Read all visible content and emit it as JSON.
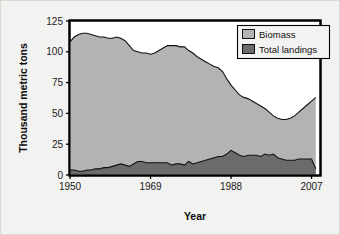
{
  "chart_data": {
    "type": "area",
    "title": "",
    "xlabel": "Year",
    "ylabel": "Thousand metric tons",
    "xlim": [
      1950,
      2009
    ],
    "ylim": [
      0,
      125
    ],
    "xticks": [
      1950,
      1969,
      1988,
      2007
    ],
    "yticks": [
      0,
      25,
      50,
      75,
      100,
      125
    ],
    "grid": false,
    "stacked": false,
    "legend_position": "top-right",
    "legend": [
      "Biomass",
      "Total landings"
    ],
    "colors": {
      "biomass": "#b3b3b3",
      "total_landings": "#6b6b6b",
      "outline": "#111111",
      "frame": "#000000",
      "plot_background": "#ffffff",
      "figure_background": "#f2f2f0"
    },
    "x": [
      1950,
      1951,
      1952,
      1953,
      1954,
      1955,
      1956,
      1957,
      1958,
      1959,
      1960,
      1961,
      1962,
      1963,
      1964,
      1965,
      1966,
      1967,
      1968,
      1969,
      1970,
      1971,
      1972,
      1973,
      1974,
      1975,
      1976,
      1977,
      1978,
      1979,
      1980,
      1981,
      1982,
      1983,
      1984,
      1985,
      1986,
      1987,
      1988,
      1989,
      1990,
      1991,
      1992,
      1993,
      1994,
      1995,
      1996,
      1997,
      1998,
      1999,
      2000,
      2001,
      2002,
      2003,
      2004,
      2005,
      2006,
      2007,
      2008
    ],
    "series": [
      {
        "name": "Biomass",
        "values": [
          108,
          112,
          114,
          115,
          115,
          114,
          113,
          112,
          112,
          111,
          111,
          112,
          111,
          109,
          105,
          101,
          100,
          99,
          99,
          98,
          99,
          101,
          103,
          105,
          105,
          105,
          104,
          104,
          101,
          99,
          96,
          94,
          92,
          90,
          88,
          87,
          84,
          78,
          73,
          69,
          65,
          63,
          62,
          60,
          58,
          56,
          54,
          51,
          48,
          46,
          45,
          45,
          46,
          48,
          51,
          54,
          57,
          60,
          63
        ]
      },
      {
        "name": "Total landings",
        "values": [
          4,
          4,
          3,
          3,
          4,
          4,
          5,
          5,
          6,
          6,
          7,
          8,
          9,
          8,
          7,
          9,
          11,
          11,
          10,
          10,
          10,
          10,
          10,
          10,
          8,
          9,
          9,
          8,
          11,
          9,
          10,
          11,
          12,
          13,
          14,
          15,
          15,
          17,
          20,
          18,
          16,
          15,
          16,
          16,
          16,
          15,
          17,
          16,
          17,
          14,
          13,
          12,
          12,
          12,
          13,
          13,
          13,
          13,
          5
        ]
      }
    ]
  },
  "axis": {
    "x_title": "Year",
    "y_title": "Thousand metric tons",
    "x_tick_labels": [
      "1950",
      "1969",
      "1988",
      "2007"
    ],
    "y_tick_labels": [
      "0",
      "25",
      "50",
      "75",
      "100",
      "125"
    ]
  },
  "legend": {
    "items": [
      {
        "label": "Biomass",
        "swatch": "#b3b3b3"
      },
      {
        "label": "Total landings",
        "swatch": "#6b6b6b"
      }
    ]
  }
}
